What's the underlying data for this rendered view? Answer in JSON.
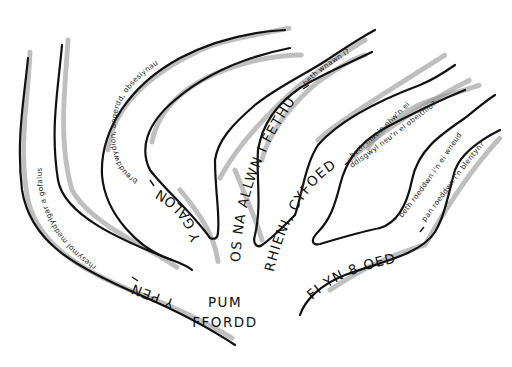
{
  "diagram": {
    "center_label": {
      "line1": "PUM",
      "line2": "FFORDD"
    },
    "roads": [
      {
        "id": "road-1",
        "title": "Y PEN",
        "dash": " – ",
        "subtitle_line1": "rhesymol meddylgar a gofalus",
        "subtitle_line2": ""
      },
      {
        "id": "road-2",
        "title": "Y GALON",
        "dash": " – ",
        "subtitle_line1": "breuddwydion, angerdd, obsesiynau",
        "subtitle_line2": ""
      },
      {
        "id": "road-3",
        "title": "OS NA ALLWN I FETHU",
        "dash": " – ",
        "subtitle_line1": "beth wnawn i?",
        "subtitle_line2": ""
      },
      {
        "id": "road-4",
        "title": "RHIENI, CYFOEDION",
        "dash": " – ",
        "subtitle_line1": "beth mae'n nhw'n ei",
        "subtitle_line2": "ddisgwyl neu'n ei obeithio?"
      },
      {
        "id": "road-5",
        "title": "FI YN 8 OED",
        "dash": " – ",
        "subtitle_line1": "beth roeddwn i'n ei wneud",
        "subtitle_line2": "pan roeddwn i'n blentyn?"
      }
    ],
    "colors": {
      "ink": "#111111",
      "paper": "#ffffff",
      "stipple": "#8a8a8a"
    }
  }
}
